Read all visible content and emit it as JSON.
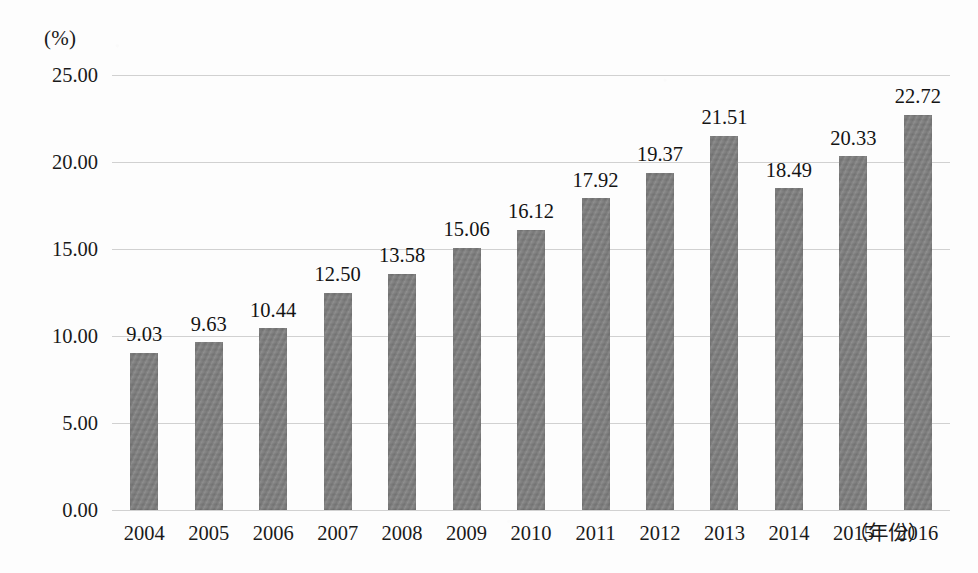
{
  "chart_data": {
    "type": "bar",
    "title": "",
    "subtitle": "",
    "xlabel": "（年份）",
    "ylabel": "(%)",
    "categories": [
      "2004",
      "2005",
      "2006",
      "2007",
      "2008",
      "2009",
      "2010",
      "2011",
      "2012",
      "2013",
      "2014",
      "2015",
      "2016"
    ],
    "values": [
      9.03,
      9.63,
      10.44,
      12.5,
      13.58,
      15.06,
      16.12,
      17.92,
      19.37,
      21.51,
      18.49,
      20.33,
      22.72
    ],
    "value_labels": [
      "9.03",
      "9.63",
      "10.44",
      "12.50",
      "13.58",
      "15.06",
      "16.12",
      "17.92",
      "19.37",
      "21.51",
      "18.49",
      "20.33",
      "22.72"
    ],
    "ylim": [
      0,
      25
    ],
    "ytick_values": [
      0,
      5,
      10,
      15,
      20,
      25
    ],
    "ytick_labels": [
      "0.00",
      "5.00",
      "10.00",
      "15.00",
      "20.00",
      "25.00"
    ],
    "grid": true,
    "grid_axis": "y",
    "legend": false,
    "legend_position": "none",
    "bar_color": "#7f7f7f",
    "grid_color": "#c9c9c9",
    "text_color": "#141414",
    "background_color": "#fdfdfd",
    "data_labels_shown": true
  }
}
